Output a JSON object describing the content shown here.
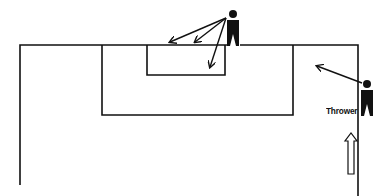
{
  "diagram": {
    "type": "soccer throw-in diagram",
    "labels": {
      "thrower": "Thrower"
    },
    "elements": {
      "field_boundary": "touchline and goal line",
      "penalty_area": "large box",
      "goal_area": "small box",
      "players": [
        "receiver near goal",
        "thrower on touchline"
      ],
      "arrows": [
        "receiver option 1",
        "receiver option 2",
        "receiver option 3",
        "throw direction",
        "thrower movement"
      ]
    },
    "colors": {
      "line": "#111111",
      "background": "#ffffff"
    }
  }
}
